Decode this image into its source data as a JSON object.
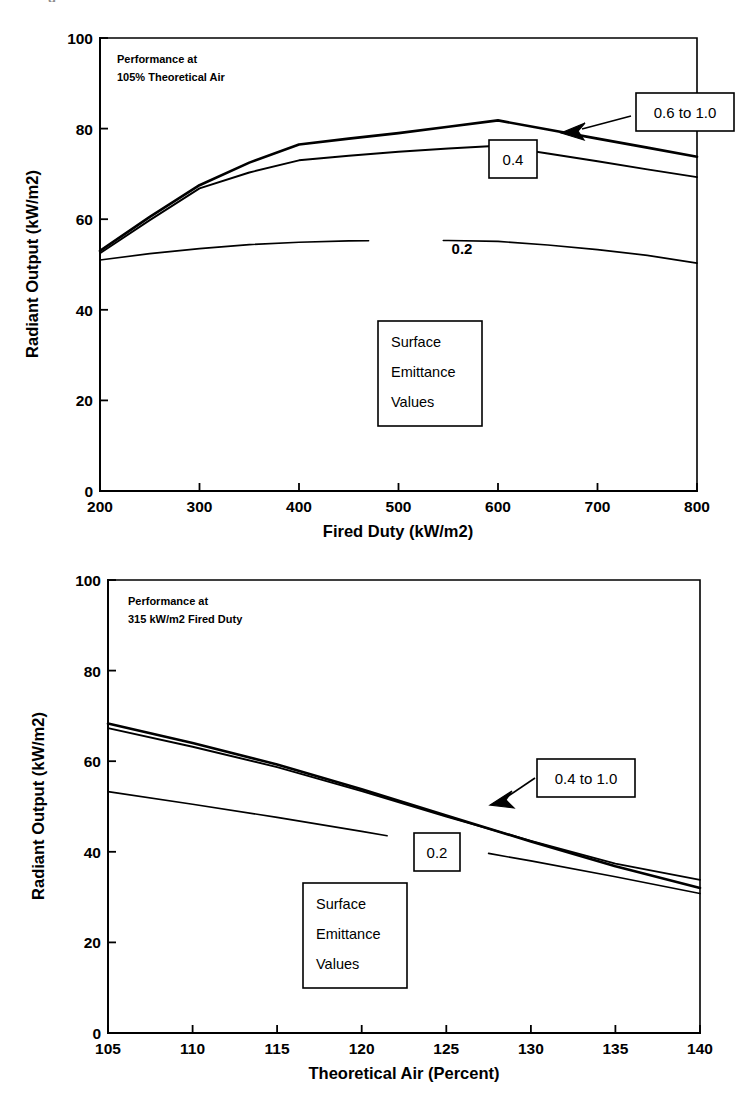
{
  "page": {
    "cropped_header_fragment": "g"
  },
  "chart_data": [
    {
      "id": "radiant-output-vs-fired-duty",
      "type": "line",
      "title": "",
      "note_lines": [
        "Performance at",
        "105% Theoretical Air"
      ],
      "xlabel": "Fired Duty (kW/m2)",
      "ylabel": "Radiant Output (kW/m2)",
      "xlim": [
        200,
        800
      ],
      "ylim": [
        0,
        100
      ],
      "xticks": [
        200,
        300,
        400,
        500,
        600,
        700,
        800
      ],
      "yticks": [
        0,
        20,
        40,
        60,
        80,
        100
      ],
      "grid": false,
      "legend_position": "inside-center",
      "legend_box_lines": [
        "Surface",
        "Emittance",
        "Values"
      ],
      "series": [
        {
          "name": "0.6 to 1.0",
          "label_style": "boxed-with-arrow",
          "x": [
            200,
            250,
            300,
            350,
            400,
            450,
            500,
            550,
            600,
            650,
            700,
            750,
            800
          ],
          "values": [
            53.0,
            60.5,
            67.5,
            72.5,
            76.5,
            77.8,
            79.0,
            80.4,
            81.8,
            79.8,
            77.8,
            75.8,
            73.8
          ]
        },
        {
          "name": "0.4",
          "label_style": "boxed",
          "x": [
            200,
            250,
            300,
            350,
            400,
            450,
            500,
            550,
            600,
            650,
            700,
            750,
            800
          ],
          "values": [
            52.5,
            59.8,
            66.8,
            70.3,
            73.0,
            74.0,
            74.9,
            75.6,
            76.2,
            74.5,
            72.8,
            71.0,
            69.3
          ]
        },
        {
          "name": "0.2",
          "label_style": "plain-inline",
          "x": [
            200,
            250,
            300,
            350,
            400,
            450,
            500,
            550,
            600,
            650,
            700,
            750,
            800
          ],
          "values": [
            51.0,
            52.4,
            53.5,
            54.4,
            54.9,
            55.2,
            55.3,
            55.3,
            55.1,
            54.3,
            53.3,
            52.0,
            50.3
          ]
        }
      ],
      "callouts": [
        {
          "text": "0.6 to 1.0",
          "style": "boxed-with-arrow"
        },
        {
          "text": "0.4",
          "style": "boxed"
        },
        {
          "text": "0.2",
          "style": "plain-inline"
        }
      ]
    },
    {
      "id": "radiant-output-vs-theoretical-air",
      "type": "line",
      "title": "",
      "note_lines": [
        "Performance at",
        "315 kW/m2 Fired Duty"
      ],
      "xlabel": "Theoretical Air (Percent)",
      "ylabel": "Radiant Output (kW/m2)",
      "xlim": [
        105,
        140
      ],
      "ylim": [
        0,
        100
      ],
      "xticks": [
        105,
        110,
        115,
        120,
        125,
        130,
        135,
        140
      ],
      "yticks": [
        0,
        20,
        40,
        60,
        80,
        100
      ],
      "grid": false,
      "legend_position": "inside-lower-center",
      "legend_box_lines": [
        "Surface",
        "Emittance",
        "Values"
      ],
      "series": [
        {
          "name": "0.4 to 1.0",
          "label_style": "boxed-with-arrow",
          "x": [
            105,
            110,
            115,
            120,
            125,
            130,
            135,
            140
          ],
          "values": [
            68.3,
            64.0,
            59.3,
            53.8,
            48.0,
            42.3,
            36.8,
            32.0
          ]
        },
        {
          "name": "1.0 upper",
          "label_style": "none",
          "x": [
            105,
            110,
            115,
            120,
            125,
            130,
            135,
            140
          ],
          "values": [
            67.3,
            63.2,
            58.7,
            53.4,
            47.8,
            42.4,
            37.4,
            33.8
          ]
        },
        {
          "name": "0.2",
          "label_style": "boxed",
          "x": [
            105,
            110,
            115,
            120,
            125,
            130,
            135,
            140
          ],
          "values": [
            53.3,
            50.5,
            47.6,
            44.5,
            41.3,
            38.0,
            34.5,
            30.8
          ]
        }
      ],
      "callouts": [
        {
          "text": "0.4 to 1.0",
          "style": "boxed-with-arrow"
        },
        {
          "text": "0.2",
          "style": "boxed"
        }
      ]
    }
  ]
}
